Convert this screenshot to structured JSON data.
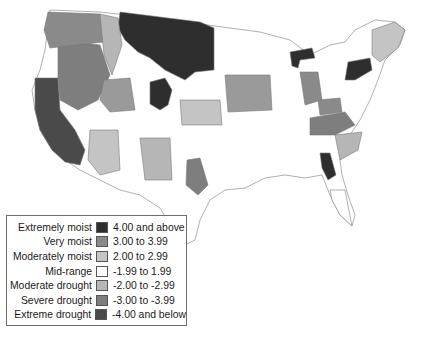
{
  "legend": {
    "items": [
      {
        "label": "Extremely moist",
        "range": "4.00 and above",
        "color": "#2e2e2e"
      },
      {
        "label": "Very moist",
        "range": "3.00 to 3.99",
        "color": "#8a8a8a"
      },
      {
        "label": "Moderately moist",
        "range": "2.00 to 2.99",
        "color": "#c4c4c4"
      },
      {
        "label": "Mid-range",
        "range": "-1.99 to 1.99",
        "color": "#ffffff"
      },
      {
        "label": "Moderate drought",
        "range": "-2.00 to -2.99",
        "color": "#b6b6b6"
      },
      {
        "label": "Severe drought",
        "range": "-3.00 to -3.99",
        "color": "#7e7e7e"
      },
      {
        "label": "Extreme drought",
        "range": "-4.00 and below",
        "color": "#4a4a4a"
      }
    ]
  },
  "colors": {
    "extremely_moist": "#2e2e2e",
    "very_moist": "#8a8a8a",
    "moderately_moist": "#c4c4c4",
    "mid_range": "#ffffff",
    "moderate_drought": "#b6b6b6",
    "severe_drought": "#7e7e7e",
    "extreme_drought": "#4a4a4a",
    "border": "#7a7a7a"
  }
}
